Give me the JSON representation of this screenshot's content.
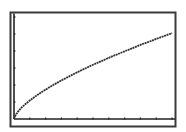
{
  "chart_data": {
    "type": "line",
    "title": "",
    "xlabel": "",
    "ylabel": "",
    "xlim": [
      0,
      10.2
    ],
    "ylim": [
      0,
      6.2
    ],
    "x_ticks": [
      1,
      2,
      3,
      4,
      5,
      6,
      7,
      8,
      9,
      10
    ],
    "y_ticks": [
      1,
      2,
      3,
      4,
      5,
      6
    ],
    "grid": false,
    "legend": "none",
    "series": [
      {
        "name": "curve",
        "x": [
          0,
          0.1,
          0.25,
          0.5,
          0.75,
          1,
          1.5,
          2,
          2.5,
          3,
          3.5,
          4,
          4.5,
          5,
          5.5,
          6,
          6.5,
          7,
          7.5,
          8,
          8.5,
          9,
          9.5,
          10
        ],
        "y": [
          0,
          0.23,
          0.43,
          0.69,
          0.9,
          1.09,
          1.43,
          1.73,
          2.01,
          2.27,
          2.51,
          2.75,
          2.97,
          3.19,
          3.39,
          3.6,
          3.79,
          3.98,
          4.17,
          4.36,
          4.53,
          4.71,
          4.88,
          5.05
        ]
      }
    ]
  },
  "colors": {
    "frame": "#3a3a3a",
    "axes": "#222222",
    "curve": "#333333",
    "background": "#ffffff"
  }
}
